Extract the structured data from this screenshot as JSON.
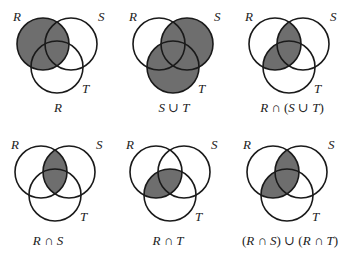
{
  "colors": {
    "shade": "#6e6e6e",
    "stroke": "#1a1a1a",
    "background": "#ffffff"
  },
  "set_labels": {
    "R": "R",
    "S": "S",
    "T": "T"
  },
  "diagrams": [
    {
      "id": "R",
      "caption": "R",
      "shaded_regions": [
        "R"
      ]
    },
    {
      "id": "S-union-T",
      "caption": "S ∪ T",
      "shaded_regions": [
        "S",
        "T"
      ]
    },
    {
      "id": "R-cap-S-union-T",
      "caption": "R ∩ (S ∪ T)",
      "shaded_regions": [
        "R∩S",
        "R∩T"
      ]
    },
    {
      "id": "R-cap-S",
      "caption": "R ∩ S",
      "shaded_regions": [
        "R∩S"
      ]
    },
    {
      "id": "R-cap-T",
      "caption": "R ∩ T",
      "shaded_regions": [
        "R∩T"
      ]
    },
    {
      "id": "RS-union-RT",
      "caption": "(R ∩ S) ∪ (R ∩ T)",
      "shaded_regions": [
        "R∩S",
        "R∩T"
      ]
    }
  ]
}
